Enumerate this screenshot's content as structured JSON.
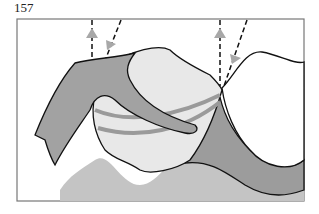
{
  "figure": {
    "number": "157",
    "type": "dental anatomical illustration",
    "colors": {
      "frame": "#777777",
      "outline": "#111111",
      "gingiva_dark": "#a0a0a0",
      "gingiva_light": "#bdbdbd",
      "tooth": "#e6e6e6",
      "background": "#ffffff",
      "arrow": "#a8a8a8"
    },
    "arrows": [
      {
        "id": "left-up",
        "direction": "up"
      },
      {
        "id": "left-down",
        "direction": "down"
      },
      {
        "id": "right-up",
        "direction": "up"
      },
      {
        "id": "right-down",
        "direction": "down"
      }
    ]
  }
}
